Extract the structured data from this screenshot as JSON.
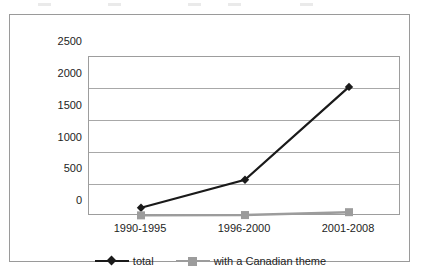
{
  "chart_data": {
    "type": "line",
    "title": "",
    "subtitle": "",
    "xlabel": "",
    "ylabel": "",
    "categories": [
      "1990-1995",
      "1996-2000",
      "2001-2008"
    ],
    "series": [
      {
        "name": "total",
        "values": [
          130,
          570,
          2030
        ],
        "color": "#1a1a1a",
        "marker": "diamond"
      },
      {
        "name": "with a Canadian theme",
        "values": [
          10,
          15,
          60
        ],
        "color": "#9c9c9c",
        "marker": "square"
      }
    ],
    "ylim": [
      0,
      2500
    ],
    "yticks": [
      0,
      500,
      1000,
      1500,
      2000,
      2500
    ],
    "ytick_labels": [
      "0",
      "500",
      "1000",
      "1500",
      "2000",
      "2500"
    ],
    "grid": true,
    "grid_axis": "y",
    "legend_position": "bottom",
    "annotations": []
  },
  "legend": {
    "items": [
      {
        "label": "total",
        "marker": "diamond-marker-icon"
      },
      {
        "label": "with a Canadian theme",
        "marker": "square-marker-icon"
      }
    ]
  },
  "colors": {
    "total_series": "#1a1a1a",
    "canadian_series": "#9c9c9c",
    "gridline": "#a8a8a8",
    "frame": "#9a9a9a",
    "text": "#1d1d1d",
    "background": "#ffffff"
  }
}
